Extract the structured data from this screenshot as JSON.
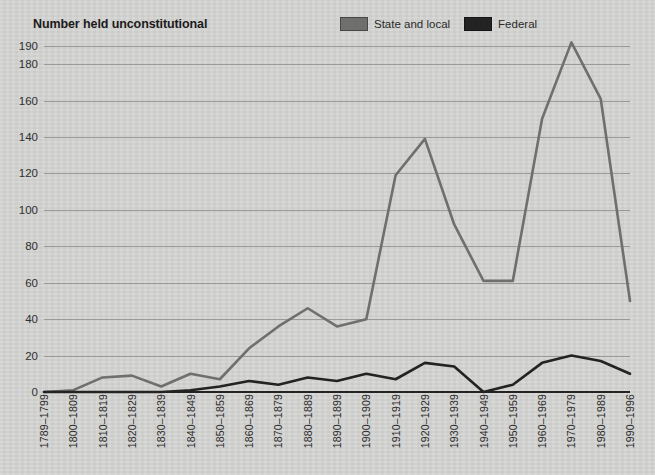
{
  "chart_data": {
    "type": "line",
    "title": "Number held unconstitutional",
    "xlabel": "",
    "ylabel": "",
    "ylim": [
      0,
      190
    ],
    "yticks": [
      0,
      20,
      40,
      60,
      80,
      100,
      120,
      140,
      160,
      180,
      190
    ],
    "grid": true,
    "legend_position": "top-right",
    "categories": [
      "1789–1799",
      "1800–1809",
      "1810–1819",
      "1820–1829",
      "1830–1839",
      "1840–1849",
      "1850–1859",
      "1860–1869",
      "1870–1879",
      "1880–1889",
      "1890–1899",
      "1900–1909",
      "1910–1919",
      "1920–1929",
      "1930–1939",
      "1940–1949",
      "1950–1959",
      "1960–1969",
      "1970–1979",
      "1980–1989",
      "1990–1996"
    ],
    "series": [
      {
        "name": "State and local",
        "color": "#6f6f6d",
        "values": [
          0,
          1,
          8,
          9,
          3,
          10,
          7,
          24,
          36,
          46,
          36,
          40,
          119,
          139,
          92,
          61,
          61,
          150,
          192,
          161,
          50
        ]
      },
      {
        "name": "Federal",
        "color": "#232323",
        "values": [
          0,
          0,
          0,
          0,
          0,
          1,
          3,
          6,
          4,
          8,
          6,
          10,
          7,
          16,
          14,
          0,
          4,
          16,
          20,
          17,
          10
        ]
      }
    ]
  },
  "legend": {
    "items": [
      {
        "label": "State and local",
        "color": "#6f6f6d"
      },
      {
        "label": "Federal",
        "color": "#232323"
      }
    ]
  },
  "colors": {
    "background": "#d4d4d2",
    "gridline": "#9a9a98",
    "axis": "#232323",
    "state_and_local": "#6f6f6d",
    "federal": "#232323",
    "text": "#2b2b2b"
  }
}
